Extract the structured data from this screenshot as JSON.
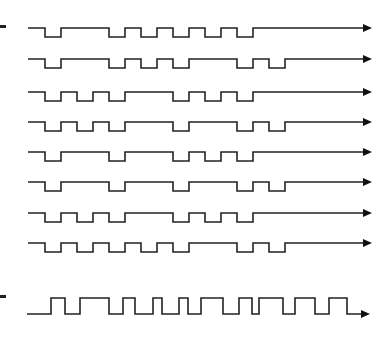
{
  "diagram": {
    "type": "timing-waveform",
    "stroke_color": "#222222",
    "background": "#ffffff",
    "cell_width": 16,
    "grid_start_x": 29,
    "line_start_x": 28,
    "arrow_end_x": 372,
    "pulse_height": 9,
    "markers": [
      {
        "name": "top-marker",
        "x": 0,
        "y": 25,
        "width": 6,
        "height": 3
      },
      {
        "name": "bottom-marker",
        "x": 0,
        "y": 295,
        "width": 6,
        "height": 3
      }
    ],
    "code_waveforms": [
      {
        "name": "waveform-1",
        "high_y": 28,
        "low_cells": [
          1,
          5,
          7,
          9,
          11,
          13
        ]
      },
      {
        "name": "waveform-2",
        "high_y": 59,
        "low_cells": [
          1,
          5,
          7,
          9,
          13,
          15
        ]
      },
      {
        "name": "waveform-3",
        "high_y": 92,
        "low_cells": [
          1,
          3,
          5,
          9,
          11,
          13
        ]
      },
      {
        "name": "waveform-4",
        "high_y": 122,
        "low_cells": [
          1,
          3,
          5,
          9,
          13,
          15
        ]
      },
      {
        "name": "waveform-5",
        "high_y": 152,
        "low_cells": [
          1,
          5,
          9,
          11,
          13
        ]
      },
      {
        "name": "waveform-6",
        "high_y": 182,
        "low_cells": [
          1,
          5,
          9,
          13,
          15
        ]
      },
      {
        "name": "waveform-7",
        "high_y": 213,
        "low_cells": [
          1,
          3,
          5,
          9,
          11,
          13
        ]
      },
      {
        "name": "waveform-8",
        "high_y": 243,
        "low_cells": [
          1,
          3,
          5,
          7,
          9,
          13,
          15
        ]
      }
    ],
    "combined_waveform": {
      "name": "combined-waveform",
      "low_y": 314,
      "high_y": 298,
      "start_x": 27,
      "transitions_x": [
        51,
        65,
        80,
        109,
        123,
        135,
        153,
        162,
        179,
        188,
        201,
        223,
        239,
        252,
        259,
        283,
        295,
        315,
        329,
        347
      ],
      "arrow_end_x": 370
    }
  }
}
